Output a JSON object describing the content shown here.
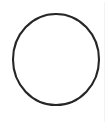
{
  "image": {
    "kind": "line-drawing",
    "subject": "circle",
    "width": 108,
    "height": 129,
    "background_color": "#ffffff",
    "caption": ""
  },
  "figure": {
    "shape_name": "circle-outline",
    "stroke_color": "#262626",
    "fill": "none",
    "stroke_width": 2.1,
    "center_x": 56,
    "center_y": 59.5,
    "radius_x": 43,
    "radius_y": 45.5,
    "bounds": {
      "left": 13,
      "top": 14,
      "right": 99,
      "bottom": 105
    }
  },
  "artifacts": {
    "right_edge_line_color": "#f0f0f0",
    "right_edge_line_x": 104
  }
}
